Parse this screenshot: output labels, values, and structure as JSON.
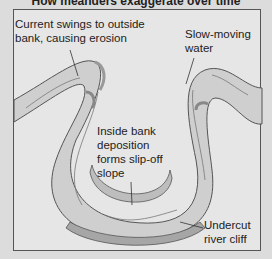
{
  "title": "How meanders exaggerate over time",
  "labels": {
    "outside_bank": "Current swings to outside\nbank, causing erosion",
    "slow_water": "Slow-moving\nwater",
    "inside_bank": "Inside bank\ndeposition\nforms slip-off\nslope",
    "undercut": "Undercut\nriver cliff"
  },
  "colors": {
    "background": "#dcdcdc",
    "panel": "#e6e6e6",
    "river": "#cfcfcf",
    "bank": "#9a9a9a",
    "outline": "#555555"
  }
}
